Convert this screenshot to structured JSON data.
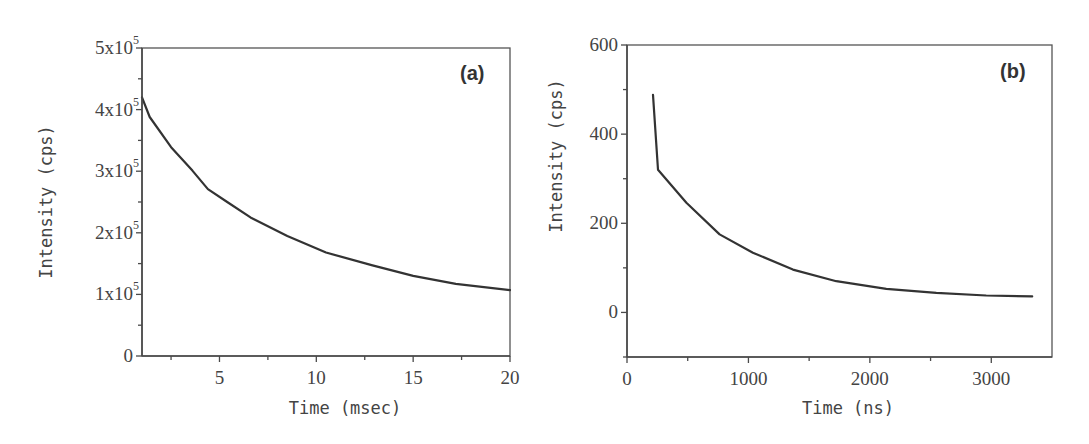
{
  "chart_data": [
    {
      "id": "a",
      "type": "line",
      "panel_label": "(a)",
      "title": "",
      "xlabel": "Time (msec)",
      "ylabel": "Intensity (cps)",
      "xlim": [
        1,
        20
      ],
      "ylim": [
        0,
        500000
      ],
      "x_ticks": [
        5,
        10,
        15,
        20
      ],
      "x_tick_labels": [
        "5",
        "10",
        "15",
        "20"
      ],
      "x_minor_ticks": [
        2.5,
        7.5,
        12.5,
        17.5
      ],
      "y_ticks": [
        0,
        100000,
        200000,
        300000,
        400000,
        500000
      ],
      "y_tick_labels": [
        {
          "mant": "0",
          "exp": ""
        },
        {
          "mant": "1x10",
          "exp": "5"
        },
        {
          "mant": "2x10",
          "exp": "5"
        },
        {
          "mant": "3x10",
          "exp": "5"
        },
        {
          "mant": "4x10",
          "exp": "5"
        },
        {
          "mant": "5x10",
          "exp": "5"
        }
      ],
      "y_minor_ticks": [
        50000,
        150000,
        250000,
        350000,
        450000
      ],
      "grid": false,
      "legend": null,
      "series": [
        {
          "name": "decay",
          "x": [
            1.0,
            1.4,
            2.5,
            3.6,
            4.4,
            5.4,
            6.6,
            8.5,
            10.5,
            12.9,
            15.0,
            17.2,
            20.0
          ],
          "y": [
            420000,
            388000,
            339000,
            301000,
            271000,
            250000,
            225000,
            195000,
            168000,
            147000,
            130000,
            117000,
            107000
          ]
        }
      ],
      "box": {
        "left": 142,
        "top": 48,
        "right": 510,
        "bottom": 356
      }
    },
    {
      "id": "b",
      "type": "line",
      "panel_label": "(b)",
      "title": "",
      "xlabel": "Time (ns)",
      "ylabel": "Intensity (cps)",
      "xlim": [
        0,
        3500
      ],
      "ylim": [
        -100,
        600
      ],
      "x_ticks": [
        0,
        1000,
        2000,
        3000
      ],
      "x_tick_labels": [
        "0",
        "1000",
        "2000",
        "3000"
      ],
      "x_minor_ticks": [
        500,
        1500,
        2500
      ],
      "y_ticks": [
        0,
        200,
        400,
        600
      ],
      "y_tick_labels": [
        {
          "mant": "0",
          "exp": ""
        },
        {
          "mant": "200",
          "exp": ""
        },
        {
          "mant": "400",
          "exp": ""
        },
        {
          "mant": "600",
          "exp": ""
        }
      ],
      "y_minor_ticks": [
        -100,
        100,
        300,
        500
      ],
      "grid": false,
      "legend": null,
      "series": [
        {
          "name": "decay",
          "x": [
            214,
            255,
            489,
            763,
            1037,
            1366,
            1724,
            2135,
            2547,
            2958,
            3337
          ],
          "y": [
            488,
            320,
            246,
            175,
            134,
            96,
            70,
            53,
            44,
            38,
            36
          ]
        }
      ],
      "box": {
        "left": 627,
        "top": 45,
        "right": 1052,
        "bottom": 357
      }
    }
  ]
}
